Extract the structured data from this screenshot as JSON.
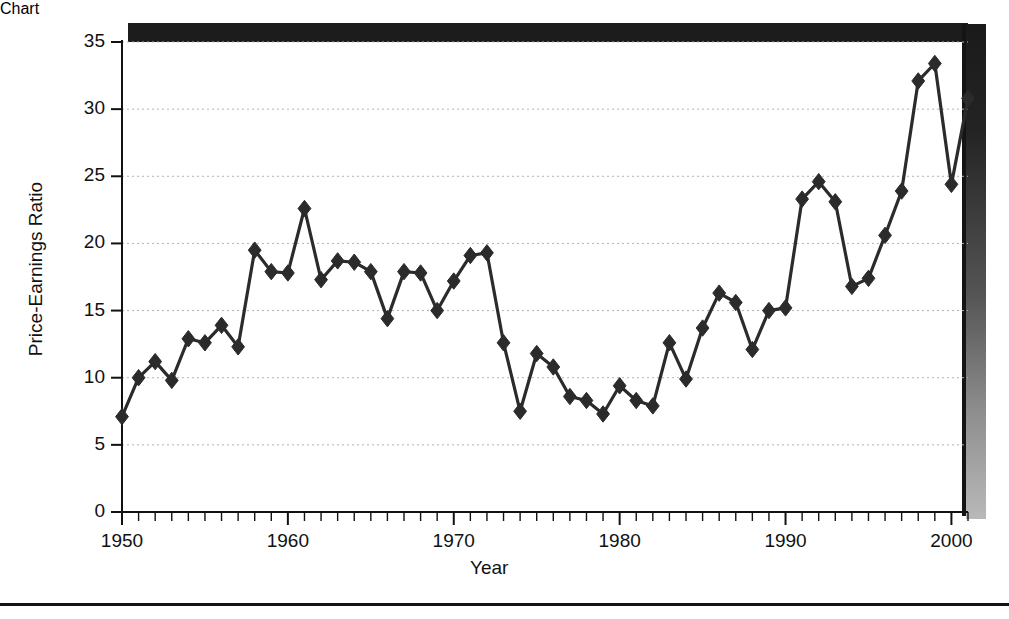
{
  "chart_data": {
    "type": "line",
    "title": "",
    "subtitle": "",
    "xlabel": "Year",
    "ylabel": "Price-Earnings Ratio",
    "xlim": [
      1950,
      2001
    ],
    "ylim": [
      0,
      35
    ],
    "y_ticks": [
      0,
      5,
      10,
      15,
      20,
      25,
      30,
      35
    ],
    "y_tick_labels": [
      "0",
      "5",
      "10",
      "15",
      "20",
      "25",
      "30",
      "35"
    ],
    "x_ticks": [
      1950,
      1960,
      1970,
      1980,
      1990,
      2000
    ],
    "x_tick_labels": [
      "1950",
      "1960",
      "1970",
      "1980",
      "1990",
      "2000"
    ],
    "x_minor_tick_interval": 1,
    "grid": "horizontal-dotted",
    "legend": "none",
    "marker": "diamond",
    "marker_color": "#2b2b2b",
    "line_color": "#2b2b2b",
    "x": [
      1950,
      1951,
      1952,
      1953,
      1954,
      1955,
      1956,
      1957,
      1958,
      1959,
      1960,
      1961,
      1962,
      1963,
      1964,
      1965,
      1966,
      1967,
      1968,
      1969,
      1970,
      1971,
      1972,
      1973,
      1974,
      1975,
      1976,
      1977,
      1978,
      1979,
      1980,
      1981,
      1982,
      1983,
      1984,
      1985,
      1986,
      1987,
      1988,
      1989,
      1990,
      1991,
      1992,
      1993,
      1994,
      1995,
      1996,
      1997,
      1998,
      1999,
      2000,
      2001
    ],
    "values": [
      7.1,
      10.0,
      11.2,
      9.8,
      12.9,
      12.6,
      13.9,
      12.3,
      19.5,
      17.9,
      17.8,
      22.6,
      17.3,
      18.7,
      18.6,
      17.9,
      14.4,
      17.9,
      17.8,
      15.0,
      17.2,
      19.1,
      19.3,
      12.6,
      7.5,
      11.8,
      10.8,
      8.6,
      8.3,
      7.3,
      9.4,
      8.3,
      7.9,
      12.6,
      9.9,
      13.7,
      16.3,
      15.6,
      12.1,
      15.0,
      15.2,
      23.3,
      24.6,
      23.1,
      16.8,
      17.4,
      20.6,
      23.9,
      32.1,
      33.4,
      24.4,
      30.8
    ],
    "series_name": "Price-Earnings Ratio"
  },
  "figure": {
    "ylabel": "Price-Earnings Ratio",
    "xlabel": "Year"
  }
}
